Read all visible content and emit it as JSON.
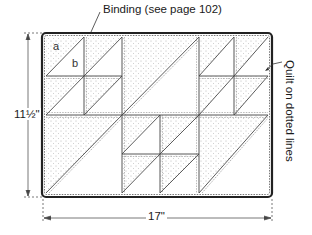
{
  "diagram": {
    "type": "quilt-layout",
    "labels": {
      "binding": "Binding (see page 102)",
      "quilt_instruction": "Quilt on dotted lines",
      "height": "11½\"",
      "width": "17\"",
      "piece_a": "a",
      "piece_b": "b"
    },
    "colors": {
      "line": "#333333",
      "dot_fill": "#888888",
      "background": "#ffffff"
    },
    "layout": {
      "big_blocks_grid": "3 columns × 2 rows",
      "small_block_positions": [
        "top-left",
        "top-right",
        "bottom-middle"
      ],
      "large_triangle_positions": [
        "top-middle",
        "bottom-left",
        "bottom-right"
      ],
      "triangle_orientation": "shaded upper-left, plain lower-right"
    }
  }
}
